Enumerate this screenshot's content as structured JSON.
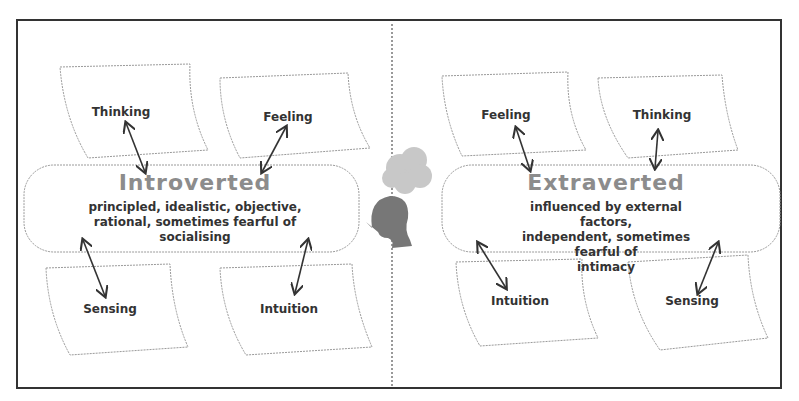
{
  "diagram": {
    "left": {
      "title": "Introverted",
      "description_lines": [
        "principled, idealistic, objective,",
        "rational, sometimes fearful of",
        "socialising"
      ],
      "top_nodes": [
        "Thinking",
        "Feeling"
      ],
      "bottom_nodes": [
        "Sensing",
        "Intuition"
      ]
    },
    "right": {
      "title": "Extraverted",
      "description_lines": [
        "influenced by external factors,",
        "independent, sometimes fearful of",
        "intimacy"
      ],
      "top_nodes": [
        "Feeling",
        "Thinking"
      ],
      "bottom_nodes": [
        "Intuition",
        "Sensing"
      ]
    },
    "center_icon": "head-with-thought-cloud-icon",
    "colors": {
      "frame": "#333333",
      "title": "#8c8c8c",
      "text": "#333333",
      "outline": "#9a9a9a"
    }
  }
}
